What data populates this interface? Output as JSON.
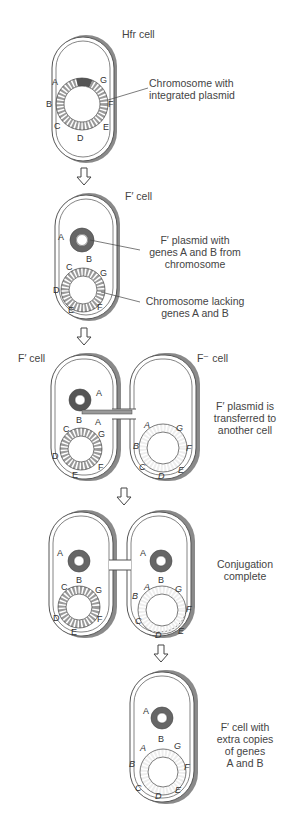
{
  "stages": [
    {
      "id": "hfr",
      "cell_label": "Hfr cell",
      "callouts": [
        "Chromosome with",
        "integrated plasmid"
      ],
      "chromosome_genes": [
        "A",
        "G",
        "B",
        "F",
        "C",
        "E",
        "D"
      ]
    },
    {
      "id": "f-prime",
      "cell_label": "F′ cell",
      "callouts": [
        [
          "F′ plasmid with",
          "genes A and B from",
          "chromosome"
        ],
        [
          "Chromosome lacking",
          "genes A and B"
        ]
      ],
      "plasmid_genes": [
        "A",
        "B"
      ],
      "chromosome_genes": [
        "C",
        "G",
        "D",
        "E",
        "F"
      ]
    },
    {
      "id": "transfer",
      "left_cell_label": "F′ cell",
      "right_cell_label": "F⁻ cell",
      "caption": [
        "F′ plasmid is",
        "transferred to",
        "another cell"
      ],
      "donor_plasmid_genes": [
        "A",
        "B",
        "A"
      ],
      "donor_chromosome_genes": [
        "C",
        "G",
        "D",
        "F",
        "E"
      ],
      "recipient_chromosome_genes": [
        "A",
        "G",
        "B",
        "F",
        "C",
        "E",
        "D"
      ]
    },
    {
      "id": "complete",
      "caption": [
        "Conjugation",
        "complete"
      ],
      "left_plasmid_genes": [
        "A",
        "B"
      ],
      "left_chromosome_genes": [
        "C",
        "G",
        "D",
        "F",
        "E"
      ],
      "right_plasmid_genes": [
        "A",
        "B"
      ],
      "right_chromosome_genes": [
        "A",
        "G",
        "B",
        "F",
        "C",
        "E",
        "D"
      ]
    },
    {
      "id": "result",
      "caption": [
        "F′ cell with",
        "extra copies",
        "of genes",
        "A and B"
      ],
      "plasmid_genes": [
        "A",
        "B"
      ],
      "chromosome_genes": [
        "A",
        "G",
        "B",
        "F",
        "C",
        "E",
        "D"
      ]
    }
  ],
  "colors": {
    "outline": "#555555",
    "wall_shade": "#8a8a8a",
    "dark_segment": "#555555",
    "medium_segment": "#9a9a9a",
    "light_segment": "#e8e8e8"
  }
}
